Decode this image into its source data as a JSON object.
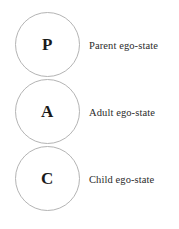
{
  "figure": {
    "background_color": "#ffffff",
    "circle_stroke_color": "#b4b4b4",
    "text_color": "#2b2b2b",
    "letter_color": "#1a1a1a"
  },
  "ego_states": [
    {
      "letter": "P",
      "label": "Parent ego-state",
      "letter_name": "parent-initial",
      "order": 1
    },
    {
      "letter": "A",
      "label": "Adult ego-state",
      "letter_name": "adult-initial",
      "order": 2
    },
    {
      "letter": "C",
      "label": "Child ego-state",
      "letter_name": "child-initial",
      "order": 3
    }
  ]
}
